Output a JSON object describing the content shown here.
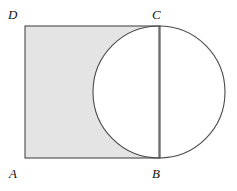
{
  "figure": {
    "type": "geometry-diagram",
    "labels": {
      "a": "A",
      "b": "B",
      "c": "C",
      "d": "D"
    },
    "colors": {
      "shade": "#e4e4e4",
      "stroke": "#4a4a4a",
      "background": "#ffffff",
      "label": "#111111"
    },
    "geometry": {
      "rectangle": {
        "x": 25,
        "y": 26,
        "width": 135,
        "height": 132,
        "corners": {
          "A": [
            25,
            158
          ],
          "B": [
            160,
            158
          ],
          "C": [
            160,
            26
          ],
          "D": [
            25,
            26
          ]
        }
      },
      "circle": {
        "cx": 159,
        "cy": 92,
        "r": 66,
        "diameter_segment": "BC"
      },
      "chord_BC": {
        "x1": 159,
        "y1": 26,
        "x2": 159,
        "y2": 158
      }
    },
    "stroke_width": 1.1
  }
}
